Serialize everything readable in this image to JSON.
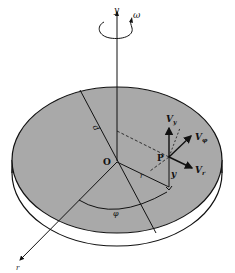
{
  "diagram": {
    "type": "rotating-disk-cylindrical-coordinates",
    "colors": {
      "disk_top": "#a9a9a9",
      "disk_edge": "#ffffff",
      "stroke": "#111111",
      "background": "#ffffff"
    },
    "labels": {
      "axis_y": "y",
      "omega": "ω",
      "origin": "O",
      "diameter": "d",
      "point": "P",
      "radius": "r",
      "height": "y",
      "angle": "φ",
      "radial_axis": "r",
      "v_y": "V",
      "v_y_sub": "y",
      "v_phi": "V",
      "v_phi_sub": "φ",
      "v_r": "V",
      "v_r_sub": "r"
    }
  }
}
